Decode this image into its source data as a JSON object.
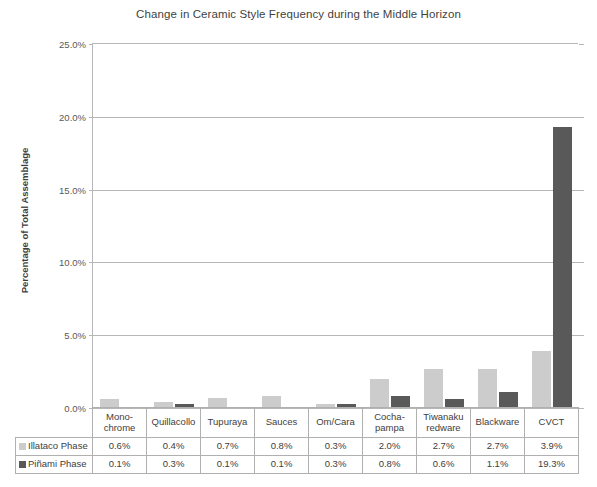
{
  "chart_data": {
    "type": "bar",
    "title": "Change in Ceramic Style Frequency during the Middle Horizon",
    "xlabel": "",
    "ylabel": "Percentage of Total Assemblage",
    "ylim": [
      0,
      25
    ],
    "ytick_labels": [
      "0.0%",
      "5.0%",
      "10.0%",
      "15.0%",
      "20.0%",
      "25.0%"
    ],
    "ytick_values": [
      0,
      5,
      10,
      15,
      20,
      25
    ],
    "grid": true,
    "legend_position": "table-left",
    "categories": [
      "Mono-\nchrome",
      "Quillacollo",
      "Tupuraya",
      "Sauces",
      "Om/Cara",
      "Cocha-\npampa",
      "Tiwanaku\nredware",
      "Blackware",
      "CVCT"
    ],
    "category_lines": [
      [
        "Mono-",
        "chrome"
      ],
      [
        "Quillacollo",
        ""
      ],
      [
        "Tupuraya",
        ""
      ],
      [
        "Sauces",
        ""
      ],
      [
        "Om/Cara",
        ""
      ],
      [
        "Cocha-",
        "pampa"
      ],
      [
        "Tiwanaku",
        "redware"
      ],
      [
        "Blackware",
        ""
      ],
      [
        "CVCT",
        ""
      ]
    ],
    "series": [
      {
        "name": "Illataco Phase",
        "color": "#cccccc",
        "values": [
          0.6,
          0.4,
          0.7,
          0.8,
          0.3,
          2.0,
          2.7,
          2.7,
          3.9
        ],
        "labels": [
          "0.6%",
          "0.4%",
          "0.7%",
          "0.8%",
          "0.3%",
          "2.0%",
          "2.7%",
          "2.7%",
          "3.9%"
        ]
      },
      {
        "name": "Piñami Phase",
        "color": "#595959",
        "values": [
          0.1,
          0.3,
          0.1,
          0.1,
          0.3,
          0.8,
          0.6,
          1.1,
          19.3
        ],
        "labels": [
          "0.1%",
          "0.3%",
          "0.1%",
          "0.1%",
          "0.3%",
          "0.8%",
          "0.6%",
          "1.1%",
          "19.3%"
        ]
      }
    ]
  },
  "colors": {
    "series_a": "#cccccc",
    "series_b": "#595959",
    "grid": "#b6b6b6",
    "text": "#404040",
    "table_border": "#b0b0b0"
  }
}
